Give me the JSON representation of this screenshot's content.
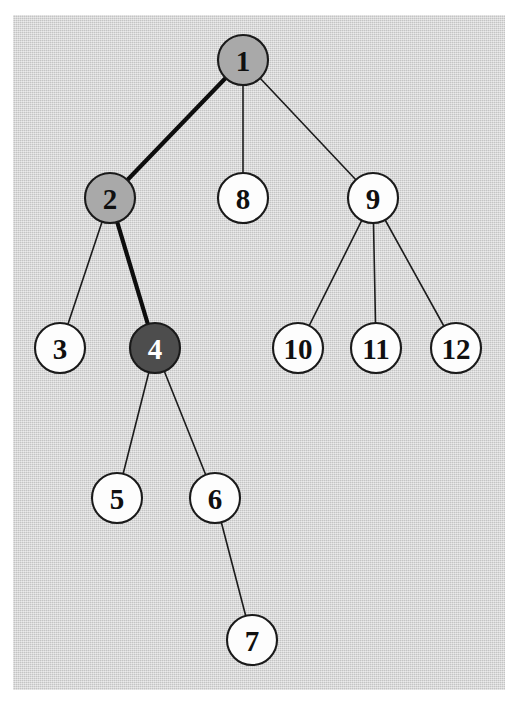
{
  "figure": {
    "kind": "tree-diagram",
    "background_color": "#ffffff",
    "canvas_color": "#d2d2d2",
    "canvas": {
      "x": 13,
      "y": 15,
      "width": 492,
      "height": 675
    }
  },
  "palette": {
    "node_white_fill": "#fdfdfd",
    "node_medium_gray_fill": "#a9a9a9",
    "node_dark_gray_fill": "#4d4d4d",
    "node_stroke": "#1a1a1a",
    "label_dark": "#101010",
    "label_light": "#ffffff",
    "edge_thin": "#1c1c1c",
    "edge_thick": "#0d0d0d"
  },
  "nodes": [
    {
      "id": "n1",
      "label": "1",
      "cx": 243,
      "cy": 60,
      "r": 25,
      "fill": "#a9a9a9",
      "text_color": "#101010",
      "highlight": "medium"
    },
    {
      "id": "n2",
      "label": "2",
      "cx": 110,
      "cy": 198,
      "r": 25,
      "fill": "#a9a9a9",
      "text_color": "#101010",
      "highlight": "medium"
    },
    {
      "id": "n8",
      "label": "8",
      "cx": 243,
      "cy": 198,
      "r": 25,
      "fill": "#fdfdfd",
      "text_color": "#101010",
      "highlight": "none"
    },
    {
      "id": "n9",
      "label": "9",
      "cx": 373,
      "cy": 198,
      "r": 25,
      "fill": "#fdfdfd",
      "text_color": "#101010",
      "highlight": "none"
    },
    {
      "id": "n3",
      "label": "3",
      "cx": 60,
      "cy": 348,
      "r": 25,
      "fill": "#fdfdfd",
      "text_color": "#101010",
      "highlight": "none"
    },
    {
      "id": "n4",
      "label": "4",
      "cx": 155,
      "cy": 348,
      "r": 25,
      "fill": "#4d4d4d",
      "text_color": "#ffffff",
      "highlight": "dark"
    },
    {
      "id": "n10",
      "label": "10",
      "cx": 298,
      "cy": 348,
      "r": 25,
      "fill": "#fdfdfd",
      "text_color": "#101010",
      "highlight": "none"
    },
    {
      "id": "n11",
      "label": "11",
      "cx": 376,
      "cy": 348,
      "r": 25,
      "fill": "#fdfdfd",
      "text_color": "#101010",
      "highlight": "none"
    },
    {
      "id": "n12",
      "label": "12",
      "cx": 456,
      "cy": 348,
      "r": 25,
      "fill": "#fdfdfd",
      "text_color": "#101010",
      "highlight": "none"
    },
    {
      "id": "n5",
      "label": "5",
      "cx": 117,
      "cy": 498,
      "r": 25,
      "fill": "#fdfdfd",
      "text_color": "#101010",
      "highlight": "none"
    },
    {
      "id": "n6",
      "label": "6",
      "cx": 215,
      "cy": 498,
      "r": 25,
      "fill": "#fdfdfd",
      "text_color": "#101010",
      "highlight": "none"
    },
    {
      "id": "n7",
      "label": "7",
      "cx": 252,
      "cy": 640,
      "r": 25,
      "fill": "#fdfdfd",
      "text_color": "#101010",
      "highlight": "none"
    }
  ],
  "edges": [
    {
      "id": "e1-2",
      "from": "n1",
      "to": "n2",
      "style": "thick"
    },
    {
      "id": "e1-8",
      "from": "n1",
      "to": "n8",
      "style": "thin"
    },
    {
      "id": "e1-9",
      "from": "n1",
      "to": "n9",
      "style": "thin"
    },
    {
      "id": "e2-3",
      "from": "n2",
      "to": "n3",
      "style": "thin"
    },
    {
      "id": "e2-4",
      "from": "n2",
      "to": "n4",
      "style": "thick"
    },
    {
      "id": "e4-5",
      "from": "n4",
      "to": "n5",
      "style": "thin"
    },
    {
      "id": "e4-6",
      "from": "n4",
      "to": "n6",
      "style": "thin"
    },
    {
      "id": "e6-7",
      "from": "n6",
      "to": "n7",
      "style": "thin"
    },
    {
      "id": "e9-10",
      "from": "n9",
      "to": "n10",
      "style": "thin"
    },
    {
      "id": "e9-11",
      "from": "n9",
      "to": "n11",
      "style": "thin"
    },
    {
      "id": "e9-12",
      "from": "n9",
      "to": "n12",
      "style": "thin"
    }
  ]
}
